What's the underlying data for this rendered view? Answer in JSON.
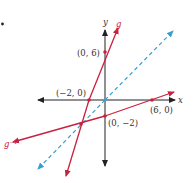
{
  "figure": {
    "bullet": "•",
    "axes": {
      "x_label": "x",
      "y_label": "y",
      "origin_px": [
        105,
        100
      ],
      "unit_px": 8
    },
    "colors": {
      "axis": "#222222",
      "g": "#c8203f",
      "g_inverse": "#c8203f",
      "identity": "#3a9fd0"
    },
    "curves": [
      {
        "name": "g",
        "label": "g",
        "equation": "y = 3x + 6",
        "style": "solid"
      },
      {
        "name": "g_inverse",
        "label": "g⁻¹",
        "equation": "y = x/3 - 2",
        "style": "solid"
      },
      {
        "name": "identity",
        "label": "",
        "equation": "y = x",
        "style": "dashed"
      }
    ],
    "points": [
      {
        "label": "(0, 6)",
        "x": 0,
        "y": 6
      },
      {
        "label": "(−2,  0)",
        "x": -2,
        "y": 0
      },
      {
        "label": "(6, 0)",
        "x": 6,
        "y": 0
      },
      {
        "label": "(0, −2)",
        "x": 0,
        "y": -2
      },
      {
        "label": "",
        "x": -3,
        "y": -3
      },
      {
        "label": "",
        "x": 0,
        "y": 0
      }
    ]
  }
}
